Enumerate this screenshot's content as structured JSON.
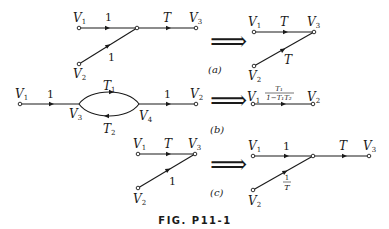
{
  "figure": {
    "caption": "FIG. P11-1",
    "implies_symbol": "⟹",
    "panels": [
      {
        "id": "a",
        "label": "(a)",
        "left": {
          "nodes": [
            "V1",
            "V2",
            "V3"
          ],
          "edges": [
            {
              "from": "V1",
              "to": "junction",
              "gain": "1"
            },
            {
              "from": "V2",
              "to": "junction",
              "gain": "1"
            },
            {
              "from": "junction",
              "to": "V3",
              "gain": "T"
            }
          ]
        },
        "right": {
          "nodes": [
            "V1",
            "V2",
            "V3"
          ],
          "edges": [
            {
              "from": "V1",
              "to": "V3",
              "gain": "T"
            },
            {
              "from": "V2",
              "to": "V3",
              "gain": "T"
            }
          ]
        }
      },
      {
        "id": "b",
        "label": "(b)",
        "left": {
          "nodes": [
            "V1",
            "V3",
            "V4",
            "V2"
          ],
          "edges": [
            {
              "from": "V1",
              "to": "V3",
              "gain": "1"
            },
            {
              "from": "V3",
              "to": "V4",
              "gain": "T1"
            },
            {
              "from": "V4",
              "to": "V3",
              "gain": "T2"
            },
            {
              "from": "V4",
              "to": "V2",
              "gain": "1"
            }
          ]
        },
        "right": {
          "nodes": [
            "V1",
            "V2"
          ],
          "edges": [
            {
              "from": "V1",
              "to": "V2",
              "gain_numerator": "T1",
              "gain_denominator": "1 − T1T2"
            }
          ]
        }
      },
      {
        "id": "c",
        "label": "(c)",
        "left": {
          "nodes": [
            "V1",
            "V2",
            "V3"
          ],
          "edges": [
            {
              "from": "V1",
              "to": "V3",
              "gain": "T"
            },
            {
              "from": "V2",
              "to": "V3",
              "gain": "1"
            }
          ]
        },
        "right": {
          "nodes": [
            "V1",
            "V2",
            "V3"
          ],
          "edges": [
            {
              "from": "V1",
              "to": "junction",
              "gain": "1"
            },
            {
              "from": "V2",
              "to": "junction",
              "gain_numerator": "1",
              "gain_denominator": "T"
            },
            {
              "from": "junction",
              "to": "V3",
              "gain": "T"
            }
          ]
        }
      }
    ]
  },
  "text": {
    "V": "V",
    "s1": "1",
    "s2": "2",
    "s3": "3",
    "s4": "4",
    "one": "1",
    "T": "T",
    "T1": "T",
    "T2": "T",
    "a": "(a)",
    "b": "(b)",
    "c": "(c)",
    "frac_num": "T₁",
    "frac_den": "1−T₁T₂",
    "inv_num": "1",
    "inv_den": "T",
    "implies": "⟹",
    "caption": "FIG. P11-1"
  }
}
